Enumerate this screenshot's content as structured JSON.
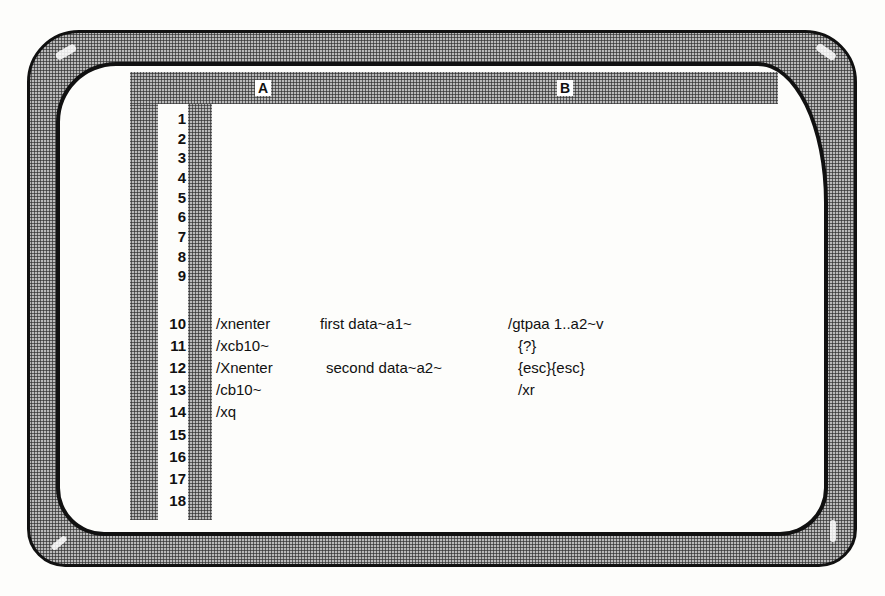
{
  "screen": {
    "type": "spreadsheet-macro-screen",
    "colors": {
      "bezel": "#b9b9b9",
      "frame": "#111111",
      "screen_bg": "#fdfdfb",
      "text": "#111111"
    }
  },
  "columns": [
    {
      "id": "A",
      "label": "A"
    },
    {
      "id": "B",
      "label": "B"
    }
  ],
  "rows": [
    {
      "num": "1",
      "cells": []
    },
    {
      "num": "2",
      "cells": []
    },
    {
      "num": "3",
      "cells": []
    },
    {
      "num": "4",
      "cells": []
    },
    {
      "num": "5",
      "cells": []
    },
    {
      "num": "6",
      "cells": []
    },
    {
      "num": "7",
      "cells": []
    },
    {
      "num": "8",
      "cells": []
    },
    {
      "num": "9",
      "cells": []
    },
    {
      "num": "10",
      "cells": [
        "/xnenter",
        "first data~a1~",
        "/gtpaa 1..a2~v"
      ]
    },
    {
      "num": "11",
      "cells": [
        "/xcb10~",
        "",
        "{?}"
      ]
    },
    {
      "num": "12",
      "cells": [
        "/Xnenter",
        "second data~a2~",
        "{esc}{esc}"
      ]
    },
    {
      "num": "13",
      "cells": [
        "/cb10~",
        "",
        "/xr"
      ]
    },
    {
      "num": "14",
      "cells": [
        "/xq",
        "",
        ""
      ]
    },
    {
      "num": "15",
      "cells": []
    },
    {
      "num": "16",
      "cells": []
    },
    {
      "num": "17",
      "cells": []
    },
    {
      "num": "18",
      "cells": []
    }
  ]
}
